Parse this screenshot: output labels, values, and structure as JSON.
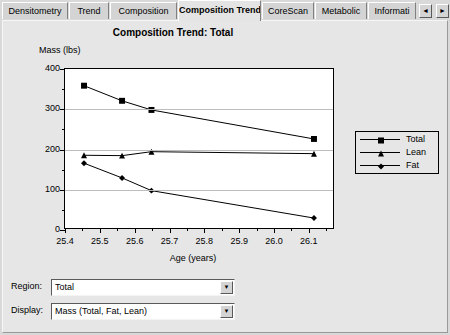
{
  "tabs": {
    "items": [
      {
        "label": "Densitometry",
        "active": false
      },
      {
        "label": "Trend",
        "active": false
      },
      {
        "label": "Composition",
        "active": false
      },
      {
        "label": "Composition Trend",
        "active": true
      },
      {
        "label": "CoreScan",
        "active": false
      },
      {
        "label": "Metabolic",
        "active": false
      },
      {
        "label": "Informati",
        "active": false
      }
    ],
    "scroll_left": "◄",
    "scroll_right": "►"
  },
  "chart_data": {
    "type": "line",
    "title": "Composition Trend: Total",
    "xlabel": "Age (years)",
    "ylabel": "Mass (lbs)",
    "xlim": [
      25.4,
      26.175
    ],
    "ylim": [
      0,
      400
    ],
    "xticks": [
      25.4,
      25.5,
      25.6,
      25.7,
      25.8,
      25.9,
      26.0,
      26.1
    ],
    "xticklabels": [
      "25.4",
      "25.5",
      "25.6",
      "25.7",
      "25.8",
      "25.9",
      "26.0",
      "26.1"
    ],
    "xminorticks": [
      25.45,
      25.55,
      25.65,
      25.75,
      25.85,
      25.95,
      26.05,
      26.15
    ],
    "yticks": [
      0,
      100,
      200,
      300,
      400
    ],
    "yticklabels": [
      "0",
      "100",
      "200",
      "300",
      "400"
    ],
    "yminorticks": [
      50,
      150,
      250,
      350
    ],
    "grid": "horizontal",
    "legend_position": "right-outside",
    "series": [
      {
        "name": "Total",
        "marker": "square",
        "x": [
          25.455,
          25.565,
          25.65,
          26.12
        ],
        "y": [
          358,
          320,
          297,
          224
        ]
      },
      {
        "name": "Lean",
        "marker": "triangle",
        "x": [
          25.455,
          25.565,
          25.65,
          26.12
        ],
        "y": [
          183,
          182,
          192,
          187
        ]
      },
      {
        "name": "Fat",
        "marker": "diamond",
        "x": [
          25.455,
          25.565,
          25.65,
          26.12
        ],
        "y": [
          163,
          126,
          94,
          25
        ]
      }
    ]
  },
  "controls": {
    "region": {
      "label": "Region:",
      "value": "Total",
      "arrow": "▼"
    },
    "display": {
      "label": "Display:",
      "value": "Mass (Total, Fat, Lean)",
      "arrow": "▼"
    }
  },
  "colors": {
    "background": "#d9d9d9",
    "panel": "#e6e6e6",
    "plot_background": "#ffffff",
    "gridline": "#bdbdbd",
    "series_line": "#000000",
    "active_tab": "#e4e4e4"
  }
}
